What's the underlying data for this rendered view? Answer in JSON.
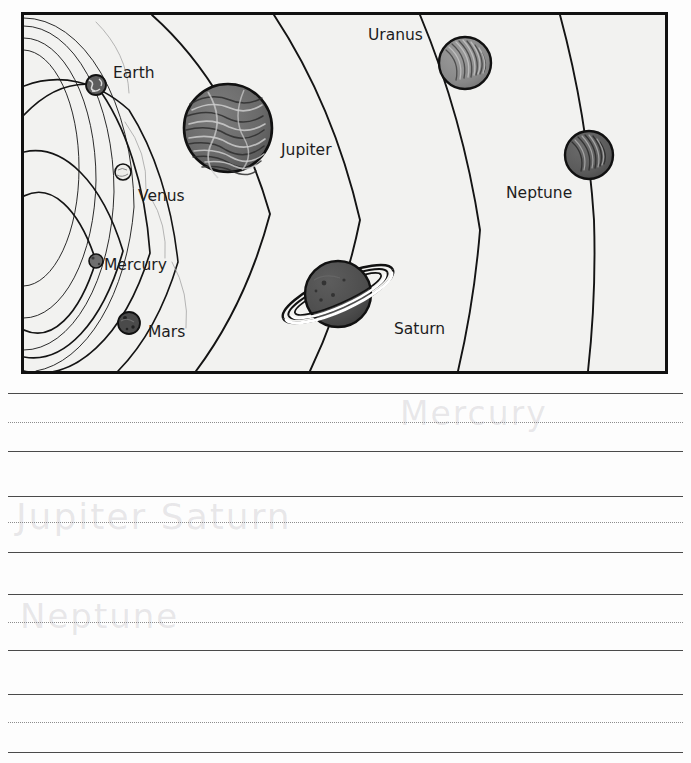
{
  "page": {
    "background_color": "#fdfdfd",
    "width": 691,
    "height": 763
  },
  "diagram": {
    "name": "solar-system-diagram",
    "frame": {
      "x": 22,
      "y": 13,
      "width": 645,
      "height": 360,
      "border_color": "#111111",
      "fill_color": "#f2f2f0"
    },
    "style": "black-and-white line drawing, concentric orbital arcs radiating from a focus off the lower-left",
    "orbit_color": "#1a1a1a",
    "planets": [
      {
        "name": "Mercury",
        "label": "Mercury",
        "label_x": 104,
        "label_y": 270,
        "cx": 96,
        "cy": 261,
        "r": 7,
        "fill": "#6f6f6f",
        "shade": "dark-gray",
        "order": 1
      },
      {
        "name": "Venus",
        "label": "Venus",
        "label_x": 138,
        "label_y": 201,
        "cx": 123,
        "cy": 172,
        "r": 8,
        "fill": "#eeeeee",
        "shade": "light",
        "order": 2
      },
      {
        "name": "Earth",
        "label": "Earth",
        "label_x": 113,
        "label_y": 78,
        "cx": 96,
        "cy": 85,
        "r": 10,
        "fill": "#5d5d5d",
        "shade": "dark-gray",
        "order": 3
      },
      {
        "name": "Mars",
        "label": "Mars",
        "label_x": 148,
        "label_y": 337,
        "cx": 129,
        "cy": 323,
        "r": 11,
        "fill": "#4a4a4a",
        "shade": "dark-gray",
        "order": 4
      },
      {
        "name": "Jupiter",
        "label": "Jupiter",
        "label_x": 281,
        "label_y": 155,
        "cx": 228,
        "cy": 128,
        "r": 44,
        "fill": "#6b6b6b",
        "shade": "banded-gray",
        "order": 5
      },
      {
        "name": "Saturn",
        "label": "Saturn",
        "label_x": 394,
        "label_y": 334,
        "cx": 338,
        "cy": 294,
        "r": 33,
        "fill": "#4f4f4f",
        "shade": "dark-gray-with-rings",
        "has_rings": true,
        "ring_tilt_deg": -24,
        "order": 6
      },
      {
        "name": "Uranus",
        "label": "Uranus",
        "label_x": 368,
        "label_y": 40,
        "cx": 465,
        "cy": 63,
        "r": 26,
        "fill": "#8a8a8a",
        "shade": "light-gray",
        "order": 7
      },
      {
        "name": "Neptune",
        "label": "Neptune",
        "label_x": 506,
        "label_y": 198,
        "cx": 589,
        "cy": 155,
        "r": 24,
        "fill": "#5b5b5b",
        "shade": "dark-gray",
        "order": 8
      }
    ]
  },
  "writing_area": {
    "name": "handwriting-practice-area",
    "line_groups": [
      {
        "top_y": 7,
        "mid_y": 36,
        "base_y": 65,
        "handwriting": "Mercury",
        "handwriting_visible": "very faint erased pencil"
      },
      {
        "top_y": 110,
        "mid_y": 136,
        "base_y": 166,
        "handwriting": "Jupiter Saturn",
        "handwriting_visible": "very faint erased pencil"
      },
      {
        "top_y": 208,
        "mid_y": 236,
        "base_y": 264,
        "handwriting": "Neptune",
        "handwriting_visible": "very faint erased pencil"
      },
      {
        "top_y": 308,
        "mid_y": 336,
        "base_y": 366,
        "handwriting": "",
        "handwriting_visible": "blank"
      }
    ],
    "solid_line_color": "#4a4a4a",
    "dotted_line_color": "#8d8d8d"
  }
}
